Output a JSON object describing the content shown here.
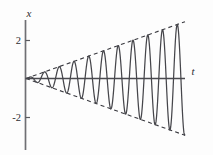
{
  "figure": {
    "name": "growing-oscillation-plot"
  },
  "axes": {
    "y_axis_label": "x",
    "x_axis_label": "t",
    "y_ticks": [
      {
        "label": "2",
        "value": 2
      },
      {
        "label": "-2",
        "value": -2
      }
    ],
    "x_ticks": []
  },
  "colors": {
    "curve": "#46464b",
    "envelope": "#3a3a40",
    "axis": "#6f6f74",
    "axis_horizontal": "#4a4a4f",
    "text": "#2d2d33",
    "background": "#fdfdfd"
  },
  "chart_data": {
    "type": "line",
    "title": "",
    "xlabel": "t",
    "ylabel": "x",
    "grid": false,
    "legend": null,
    "xlim": [
      0,
      12.2
    ],
    "ylim": [
      -3.05,
      3.05
    ],
    "ytick_values": [
      2,
      -2
    ],
    "ytick_labels": [
      "2",
      "-2"
    ],
    "xtick_values": [],
    "xtick_labels": [],
    "equation": "x(t) = 0.245 t sin(5.55 t)",
    "series": [
      {
        "name": "x(t) = 0.245 t sin(5.55 t)",
        "style": "solid",
        "color": "#46464b",
        "amplitude_slope": 0.245,
        "angular_frequency": 5.55,
        "phase": 0,
        "t_start": 0,
        "t_end": 12.2,
        "num_visible_cycles": 10.8,
        "peak_amplitudes": [
          0.28,
          0.56,
          0.84,
          1.12,
          1.4,
          1.68,
          1.96,
          2.24,
          2.52,
          2.8
        ]
      },
      {
        "name": "upper envelope",
        "style": "dashed",
        "color": "#3a3a40",
        "points": [
          [
            0,
            0
          ],
          [
            12.2,
            2.99
          ]
        ]
      },
      {
        "name": "lower envelope",
        "style": "dashed",
        "color": "#3a3a40",
        "points": [
          [
            0,
            0
          ],
          [
            12.2,
            -2.99
          ]
        ]
      }
    ]
  }
}
